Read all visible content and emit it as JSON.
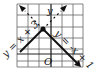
{
  "diagram": {
    "type": "coordinate-graph",
    "axis_y_label": "y",
    "origin_label": "O",
    "lines": [
      {
        "name": "left-line",
        "equation": "y = x + 3",
        "label": "y = x + 3"
      },
      {
        "name": "right-line",
        "equation": "y = -x + 1",
        "label": "y = -x + 1"
      }
    ],
    "vertex": {
      "x": -1,
      "y": 2
    },
    "colors": {
      "line": "#111111",
      "grid": "#555555",
      "background": "#ffffff"
    }
  }
}
